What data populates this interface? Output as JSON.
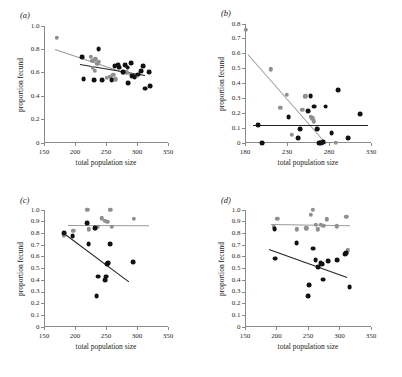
{
  "figure": {
    "axis_titles": {
      "x": "total population size",
      "y": "proportion fecund"
    }
  },
  "chart_data": [
    {
      "type": "scatter",
      "panel_label": "(a)",
      "title": "",
      "xlabel": "total population size",
      "ylabel": "proportion fecund",
      "xlim": [
        150,
        350
      ],
      "ylim": [
        0,
        1.0
      ],
      "xticks": [
        150,
        200,
        250,
        300,
        350
      ],
      "yticks": [
        "0",
        "0.2",
        "0.4",
        "0.6",
        "0.8",
        "1.0"
      ],
      "ytick_values": [
        0,
        0.2,
        0.4,
        0.6,
        0.8,
        1.0
      ],
      "grid": false,
      "legend": "none",
      "series": [
        {
          "name": "grey",
          "color": "#8f8f8f",
          "points": [
            [
              171,
              0.9
            ],
            [
              211,
              0.735
            ],
            [
              225,
              0.735
            ],
            [
              228,
              0.705
            ],
            [
              233,
              0.715
            ],
            [
              236,
              0.675
            ],
            [
              238,
              0.695
            ],
            [
              229,
              0.645
            ],
            [
              232,
              0.615
            ],
            [
              251,
              0.555
            ],
            [
              257,
              0.565
            ],
            [
              262,
              0.585
            ],
            [
              265,
              0.545
            ],
            [
              277,
              0.605
            ],
            [
              283,
              0.605
            ],
            [
              292,
              0.585
            ],
            [
              296,
              0.575
            ]
          ],
          "fit": {
            "x0": 168,
            "y0": 0.805,
            "x1": 303,
            "y1": 0.565
          }
        },
        {
          "name": "black",
          "color": "#121212",
          "points": [
            [
              211,
              0.735
            ],
            [
              214,
              0.545
            ],
            [
              231,
              0.535
            ],
            [
              238,
              0.8
            ],
            [
              244,
              0.535
            ],
            [
              259,
              0.535
            ],
            [
              264,
              0.655
            ],
            [
              269,
              0.665
            ],
            [
              271,
              0.645
            ],
            [
              277,
              0.605
            ],
            [
              281,
              0.665
            ],
            [
              285,
              0.645
            ],
            [
              286,
              0.515
            ],
            [
              290,
              0.685
            ],
            [
              292,
              0.575
            ],
            [
              296,
              0.565
            ],
            [
              302,
              0.585
            ],
            [
              307,
              0.615
            ],
            [
              310,
              0.655
            ],
            [
              313,
              0.465
            ],
            [
              319,
              0.605
            ],
            [
              321,
              0.485
            ]
          ],
          "fit": {
            "x0": 208,
            "y0": 0.672,
            "x1": 313,
            "y1": 0.578
          }
        }
      ]
    },
    {
      "type": "scatter",
      "panel_label": "(b)",
      "title": "",
      "xlabel": "total population size",
      "ylabel": "proportion fecund",
      "xlim": [
        180,
        330
      ],
      "ylim": [
        0,
        0.8
      ],
      "xticks": [
        180,
        230,
        280,
        330
      ],
      "yticks": [
        "0",
        "0.1",
        "0.2",
        "0.3",
        "0.4",
        "0.5",
        "0.6",
        "0.7",
        "0.8"
      ],
      "ytick_values": [
        0,
        0.1,
        0.2,
        0.3,
        0.4,
        0.5,
        0.6,
        0.7,
        0.8
      ],
      "grid": false,
      "legend": "none",
      "series": [
        {
          "name": "grey",
          "color": "#8f8f8f",
          "points": [
            [
              181,
              0.76
            ],
            [
              211,
              0.495
            ],
            [
              222,
              0.235
            ],
            [
              230,
              0.325
            ],
            [
              236,
              0.055
            ],
            [
              248,
              0.225
            ],
            [
              252,
              0.315
            ],
            [
              258,
              0.175
            ],
            [
              260,
              0.165
            ],
            [
              262,
              0.145
            ],
            [
              266,
              0.095
            ],
            [
              270,
              0.005
            ],
            [
              272,
              0.0
            ],
            [
              288,
              0.0
            ]
          ],
          "fit": {
            "x0": 183,
            "y0": 0.6,
            "x1": 276,
            "y1": 0.0
          }
        },
        {
          "name": "black",
          "color": "#121212",
          "points": [
            [
              196,
              0.12
            ],
            [
              200,
              0.0
            ],
            [
              232,
              0.175
            ],
            [
              243,
              0.035
            ],
            [
              246,
              0.095
            ],
            [
              255,
              0.215
            ],
            [
              258,
              0.315
            ],
            [
              262,
              0.245
            ],
            [
              266,
              0.095
            ],
            [
              268,
              0.0
            ],
            [
              271,
              0.0
            ],
            [
              273,
              0.005
            ],
            [
              276,
              0.245
            ],
            [
              283,
              0.065
            ],
            [
              291,
              0.355
            ],
            [
              303,
              0.035
            ],
            [
              317,
              0.195
            ]
          ],
          "fit": {
            "x0": 189,
            "y0": 0.122,
            "x1": 326,
            "y1": 0.122
          }
        }
      ]
    },
    {
      "type": "scatter",
      "panel_label": "(c)",
      "title": "",
      "xlabel": "total population size",
      "ylabel": "proportion fecund",
      "xlim": [
        150,
        350
      ],
      "ylim": [
        0,
        1.0
      ],
      "xticks": [
        150,
        200,
        250,
        300,
        350
      ],
      "yticks": [
        "0",
        "0.1",
        "0.2",
        "0.3",
        "0.4",
        "0.5",
        "0.6",
        "0.7",
        "0.8",
        "0.9",
        "1.0"
      ],
      "ytick_values": [
        0,
        0.1,
        0.2,
        0.3,
        0.4,
        0.5,
        0.6,
        0.7,
        0.8,
        0.9,
        1.0
      ],
      "grid": false,
      "legend": "none",
      "series": [
        {
          "name": "grey",
          "color": "#8f8f8f",
          "points": [
            [
              182,
              0.785
            ],
            [
              197,
              0.82
            ],
            [
              220,
              1.0
            ],
            [
              222,
              0.835
            ],
            [
              232,
              0.845
            ],
            [
              237,
              0.855
            ],
            [
              243,
              0.93
            ],
            [
              248,
              0.91
            ],
            [
              252,
              0.9
            ],
            [
              257,
              1.0
            ],
            [
              259,
              0.855
            ],
            [
              295,
              0.925
            ]
          ],
          "fit": {
            "x0": 188,
            "y0": 0.875,
            "x1": 318,
            "y1": 0.873
          }
        },
        {
          "name": "black",
          "color": "#121212",
          "points": [
            [
              182,
              0.805
            ],
            [
              196,
              0.775
            ],
            [
              220,
              0.885
            ],
            [
              222,
              0.71
            ],
            [
              232,
              0.845
            ],
            [
              235,
              0.265
            ],
            [
              237,
              0.43
            ],
            [
              248,
              0.4
            ],
            [
              250,
              0.43
            ],
            [
              252,
              0.54
            ],
            [
              254,
              0.545
            ],
            [
              257,
              0.71
            ],
            [
              294,
              0.555
            ]
          ],
          "fit": {
            "x0": 183,
            "y0": 0.8,
            "x1": 288,
            "y1": 0.385
          }
        }
      ]
    },
    {
      "type": "scatter",
      "panel_label": "(d)",
      "title": "",
      "xlabel": "total population size",
      "ylabel": "proportion fecund",
      "xlim": [
        150,
        350
      ],
      "ylim": [
        0,
        1.0
      ],
      "xticks": [
        150,
        200,
        250,
        300,
        350
      ],
      "yticks": [
        "0",
        "0.1",
        "0.2",
        "0.3",
        "0.4",
        "0.5",
        "0.6",
        "0.7",
        "0.8",
        "0.9",
        "1.0"
      ],
      "ytick_values": [
        0,
        0.1,
        0.2,
        0.3,
        0.4,
        0.5,
        0.6,
        0.7,
        0.8,
        0.9,
        1.0
      ],
      "grid": false,
      "legend": "none",
      "series": [
        {
          "name": "grey",
          "color": "#8f8f8f",
          "points": [
            [
              196,
              0.855
            ],
            [
              201,
              0.925
            ],
            [
              232,
              0.835
            ],
            [
              247,
              0.845
            ],
            [
              254,
              0.96
            ],
            [
              258,
              1.0
            ],
            [
              262,
              0.875
            ],
            [
              266,
              0.835
            ],
            [
              270,
              0.875
            ],
            [
              274,
              0.865
            ],
            [
              280,
              0.92
            ],
            [
              296,
              0.86
            ],
            [
              311,
              0.94
            ],
            [
              313,
              0.655
            ]
          ],
          "fit": {
            "x0": 192,
            "y0": 0.878,
            "x1": 318,
            "y1": 0.868
          }
        },
        {
          "name": "black",
          "color": "#121212",
          "points": [
            [
              197,
              0.84
            ],
            [
              198,
              0.585
            ],
            [
              232,
              0.72
            ],
            [
              250,
              0.265
            ],
            [
              252,
              0.355
            ],
            [
              258,
              0.67
            ],
            [
              262,
              0.57
            ],
            [
              266,
              0.515
            ],
            [
              270,
              0.545
            ],
            [
              272,
              0.535
            ],
            [
              274,
              0.405
            ],
            [
              282,
              0.565
            ],
            [
              296,
              0.57
            ],
            [
              309,
              0.62
            ],
            [
              311,
              0.635
            ],
            [
              316,
              0.34
            ]
          ],
          "fit": {
            "x0": 188,
            "y0": 0.665,
            "x1": 312,
            "y1": 0.425
          }
        }
      ]
    }
  ]
}
